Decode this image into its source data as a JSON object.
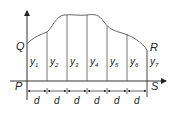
{
  "diagram": {
    "type": "trapezoidal/simpson area diagram",
    "points": {
      "P": "P",
      "Q": "Q",
      "R": "R",
      "S": "S"
    },
    "ordinates": [
      {
        "name": "y",
        "sub": "1"
      },
      {
        "name": "y",
        "sub": "2"
      },
      {
        "name": "y",
        "sub": "3"
      },
      {
        "name": "y",
        "sub": "4"
      },
      {
        "name": "y",
        "sub": "5"
      },
      {
        "name": "y",
        "sub": "6"
      },
      {
        "name": "y",
        "sub": "7"
      }
    ],
    "interval_label": "d",
    "interval_count": 6,
    "colors": {
      "line": "#333333",
      "curve": "#555555",
      "text": "#222222"
    }
  }
}
